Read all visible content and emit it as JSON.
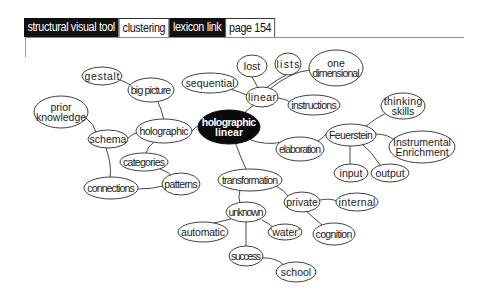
{
  "header": {
    "segments": [
      {
        "label": "structural visual tool",
        "style": "dark"
      },
      {
        "label": "clustering",
        "style": "light"
      },
      {
        "label": "lexicon link",
        "style": "dark"
      },
      {
        "label": "page 154",
        "style": "light"
      }
    ]
  },
  "colors": {
    "center_fill": "#0a0a0a",
    "node_fill": "#ffffff",
    "stroke": "#2a2a2a"
  },
  "mindmap": {
    "center": {
      "id": "hl",
      "lines": [
        "holographic",
        "linear"
      ]
    },
    "nodes": [
      {
        "id": "linear",
        "lines": [
          "linear"
        ]
      },
      {
        "id": "lost",
        "lines": [
          "lost"
        ]
      },
      {
        "id": "lists",
        "lines": [
          "lists"
        ]
      },
      {
        "id": "onedim",
        "lines": [
          "one",
          "dimensional"
        ]
      },
      {
        "id": "instructions",
        "lines": [
          "instructions"
        ]
      },
      {
        "id": "sequential",
        "lines": [
          "sequential"
        ]
      },
      {
        "id": "holographic",
        "lines": [
          "holographic"
        ]
      },
      {
        "id": "bigpicture",
        "lines": [
          "big picture"
        ]
      },
      {
        "id": "gestalt",
        "lines": [
          "gestalt"
        ]
      },
      {
        "id": "schema",
        "lines": [
          "schema"
        ]
      },
      {
        "id": "prior",
        "lines": [
          "prior",
          "knowledge"
        ]
      },
      {
        "id": "connections",
        "lines": [
          "connections"
        ]
      },
      {
        "id": "categories",
        "lines": [
          "categories"
        ]
      },
      {
        "id": "patterns",
        "lines": [
          "patterns"
        ]
      },
      {
        "id": "elaboration",
        "lines": [
          "elaboration"
        ]
      },
      {
        "id": "feuerstein",
        "lines": [
          "Feuerstein"
        ]
      },
      {
        "id": "thinking",
        "lines": [
          "thinking",
          "skills"
        ]
      },
      {
        "id": "ie",
        "lines": [
          "Instrumental",
          "Enrichment"
        ]
      },
      {
        "id": "input",
        "lines": [
          "input"
        ]
      },
      {
        "id": "output",
        "lines": [
          "output"
        ]
      },
      {
        "id": "transformation",
        "lines": [
          "transformation"
        ]
      },
      {
        "id": "private",
        "lines": [
          "private"
        ]
      },
      {
        "id": "internal",
        "lines": [
          "internal"
        ]
      },
      {
        "id": "cognition",
        "lines": [
          "cognition"
        ]
      },
      {
        "id": "unknown",
        "lines": [
          "unknown"
        ]
      },
      {
        "id": "automatic",
        "lines": [
          "automatic"
        ]
      },
      {
        "id": "water",
        "lines": [
          "'water'"
        ]
      },
      {
        "id": "success",
        "lines": [
          "success"
        ]
      },
      {
        "id": "school",
        "lines": [
          "school"
        ]
      }
    ],
    "edges": [
      [
        "hl",
        "linear"
      ],
      [
        "linear",
        "lost"
      ],
      [
        "linear",
        "lists"
      ],
      [
        "linear",
        "onedim"
      ],
      [
        "linear",
        "instructions"
      ],
      [
        "linear",
        "sequential"
      ],
      [
        "hl",
        "holographic"
      ],
      [
        "holographic",
        "bigpicture"
      ],
      [
        "bigpicture",
        "gestalt"
      ],
      [
        "holographic",
        "schema"
      ],
      [
        "schema",
        "prior"
      ],
      [
        "schema",
        "connections"
      ],
      [
        "holographic",
        "categories"
      ],
      [
        "categories",
        "patterns"
      ],
      [
        "connections",
        "patterns"
      ],
      [
        "hl",
        "elaboration"
      ],
      [
        "elaboration",
        "feuerstein"
      ],
      [
        "feuerstein",
        "thinking"
      ],
      [
        "feuerstein",
        "ie"
      ],
      [
        "feuerstein",
        "input"
      ],
      [
        "feuerstein",
        "output"
      ],
      [
        "hl",
        "transformation"
      ],
      [
        "transformation",
        "private"
      ],
      [
        "private",
        "internal"
      ],
      [
        "private",
        "cognition"
      ],
      [
        "transformation",
        "unknown"
      ],
      [
        "unknown",
        "automatic"
      ],
      [
        "unknown",
        "water"
      ],
      [
        "unknown",
        "success"
      ],
      [
        "success",
        "school"
      ]
    ]
  }
}
